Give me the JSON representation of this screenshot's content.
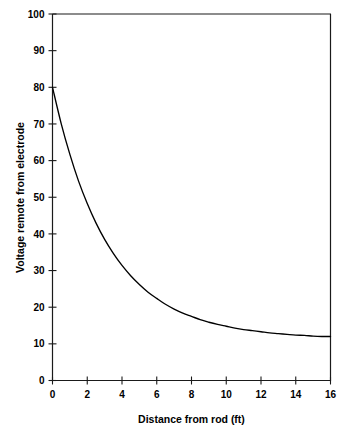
{
  "chart_data": {
    "type": "line",
    "title": "",
    "subtitle": "",
    "xlabel": "Distance from rod (ft)",
    "ylabel": "Voltage remote from electrode",
    "xlim": [
      0,
      16
    ],
    "ylim": [
      0,
      100
    ],
    "grid": false,
    "legend": false,
    "legend_position": "none",
    "xticks": [
      0,
      2,
      4,
      6,
      8,
      10,
      12,
      14,
      16
    ],
    "xtick_labels": [
      "0",
      "2",
      "4",
      "6",
      "8",
      "10",
      "12",
      "14",
      "16"
    ],
    "yticks": [
      0,
      10,
      20,
      30,
      40,
      50,
      60,
      70,
      80,
      90,
      100
    ],
    "ytick_labels": [
      "0",
      "10",
      "20",
      "30",
      "40",
      "50",
      "60",
      "70",
      "80",
      "90",
      "100"
    ],
    "series": [
      {
        "name": "Voltage remote from electrode",
        "color": "#000000",
        "x": [
          0,
          0.5,
          1,
          1.5,
          2,
          2.5,
          3,
          3.5,
          4,
          4.5,
          5,
          5.5,
          6,
          6.5,
          7,
          7.5,
          8,
          8.5,
          9,
          9.5,
          10,
          10.5,
          11,
          11.5,
          12,
          12.5,
          13,
          13.5,
          14,
          14.5,
          15,
          15.5,
          16
        ],
        "values": [
          80,
          70.1,
          61.7,
          54.4,
          48.3,
          43,
          38.5,
          34.7,
          31.4,
          28.6,
          26.2,
          24.1,
          22.4,
          20.8,
          19.5,
          18.4,
          17.5,
          16.6,
          15.9,
          15.3,
          14.8,
          14.3,
          13.9,
          13.6,
          13.3,
          13,
          12.8,
          12.6,
          12.4,
          12.3,
          12.1,
          12,
          12
        ]
      }
    ]
  },
  "axes": {
    "x_axis_title": "Distance from rod (ft)",
    "y_axis_title": "Voltage remote from electrode"
  },
  "colors": {
    "curve": "#000000",
    "frame": "#1a1a1a",
    "background": "#ffffff"
  }
}
